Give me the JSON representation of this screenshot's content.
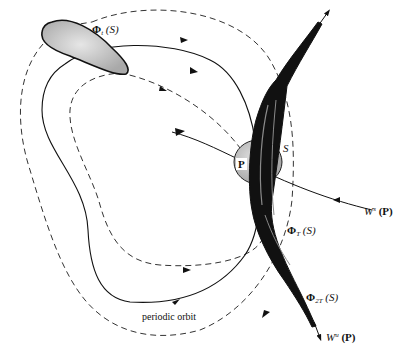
{
  "figure": {
    "type": "dynamical-systems-diagram"
  },
  "labels": {
    "phi_t": {
      "symbol": "Φ",
      "sub": "t",
      "arg": "(S)"
    },
    "phi_T": {
      "symbol": "Φ",
      "sub": "T",
      "arg": "(S)"
    },
    "phi_2T": {
      "symbol": "Φ",
      "sub": "2T",
      "arg": "(S)"
    },
    "section": "S",
    "point": "P",
    "stable_manifold": {
      "symbol": "W",
      "sup": "s",
      "arg": "(P)"
    },
    "unstable_manifold": {
      "symbol": "W",
      "sup": "u",
      "arg": "(P)"
    },
    "orbit": "periodic orbit"
  },
  "colors": {
    "line": "#111111",
    "dashed": "#333333",
    "region_fill": "#bdbdbd",
    "region_dark": "#111111",
    "background": "#ffffff"
  }
}
